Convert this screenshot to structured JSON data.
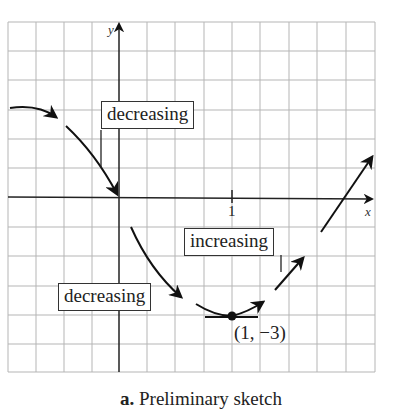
{
  "diagram": {
    "x_axis_label": "x",
    "y_axis_label": "y",
    "x_tick_label": "1",
    "labels": {
      "decreasing_upper": "decreasing",
      "decreasing_lower": "decreasing",
      "increasing": "increasing"
    },
    "minimum_point_label": "(1, −3)",
    "minimum_point": {
      "x": 1,
      "y": -3
    }
  },
  "caption": {
    "letter": "a.",
    "text": "Preliminary sketch"
  }
}
